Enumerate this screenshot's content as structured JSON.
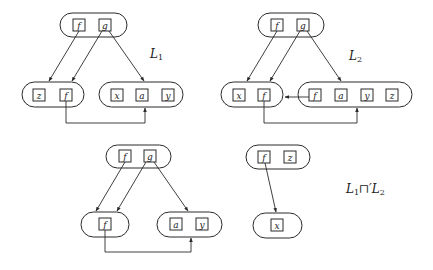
{
  "diagrams": [
    {
      "label": "L",
      "label_sub": "1",
      "top_node": [
        "f",
        "g"
      ],
      "left_node": [
        "z",
        "f"
      ],
      "right_node": [
        "x",
        "a",
        "y"
      ],
      "edges": [
        {
          "from": "top.f",
          "to": "left"
        },
        {
          "from": "top.g",
          "to": "left.f"
        },
        {
          "from": "top.g",
          "to": "right.a"
        },
        {
          "from": "left.f",
          "to": "right.a"
        }
      ]
    },
    {
      "label": "L",
      "label_sub": "2",
      "top_node": [
        "f",
        "g"
      ],
      "left_node": [
        "x",
        "f"
      ],
      "right_node": [
        "f",
        "a",
        "y",
        "z"
      ],
      "edges": [
        {
          "from": "top.f",
          "to": "left"
        },
        {
          "from": "top.g",
          "to": "left.f"
        },
        {
          "from": "top.g",
          "to": "right"
        },
        {
          "from": "right.f",
          "to": "left.f"
        },
        {
          "from": "left.f",
          "to": "right"
        }
      ]
    },
    {
      "top_node": [
        "f",
        "g"
      ],
      "left_node": [
        "f"
      ],
      "right_node": [
        "a",
        "y"
      ],
      "edges": [
        {
          "from": "top.f",
          "to": "left"
        },
        {
          "from": "top.g",
          "to": "left.f"
        },
        {
          "from": "top.g",
          "to": "right.a"
        },
        {
          "from": "left.f",
          "to": "right"
        }
      ]
    },
    {
      "label": "L",
      "label_sub": "1",
      "label_op": "⊓′",
      "label2": "L",
      "label2_sub": "2",
      "top_node": [
        "f",
        "z"
      ],
      "bottom_node": [
        "x"
      ],
      "edges": [
        {
          "from": "top.f",
          "to": "bottom.x"
        }
      ]
    }
  ],
  "colors": {
    "stroke": "#2a2a2a",
    "text": "#222222",
    "background": "#ffffff"
  }
}
